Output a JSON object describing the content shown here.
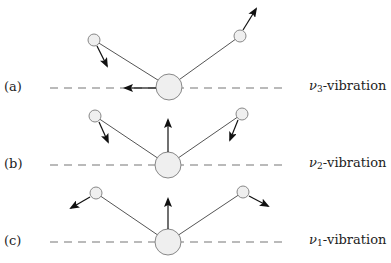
{
  "colors": {
    "atom_fill": "#efefef",
    "atom_stroke": "#888888",
    "bond": "#555555",
    "dash": "#777777",
    "arrow": "#111111",
    "text": "#222222"
  },
  "panels": [
    {
      "id": "a",
      "label": "(a)",
      "mode_symbol": "ν",
      "mode_subscript": "3",
      "mode_suffix": "-vibration",
      "axis_y": 88,
      "central_atom": {
        "cx": 169,
        "cy": 87,
        "r": 13
      },
      "left_atom": {
        "cx": 94,
        "cy": 40,
        "r": 6
      },
      "right_atom": {
        "cx": 240,
        "cy": 36,
        "r": 6
      },
      "arrows": [
        {
          "name": "central-atom-displacement",
          "x1": 156,
          "y1": 88,
          "x2": 125,
          "y2": 88
        },
        {
          "name": "left-atom-displacement",
          "x1": 97,
          "y1": 46,
          "x2": 107,
          "y2": 66
        },
        {
          "name": "right-atom-displacement",
          "x1": 243,
          "y1": 30,
          "x2": 256,
          "y2": 9
        }
      ]
    },
    {
      "id": "b",
      "label": "(b)",
      "mode_symbol": "ν",
      "mode_subscript": "2",
      "mode_suffix": "-vibration",
      "axis_y": 165,
      "central_atom": {
        "cx": 168,
        "cy": 165,
        "r": 13
      },
      "left_atom": {
        "cx": 95,
        "cy": 116,
        "r": 6
      },
      "right_atom": {
        "cx": 242,
        "cy": 114,
        "r": 6
      },
      "arrows": [
        {
          "name": "central-atom-displacement",
          "x1": 168,
          "y1": 152,
          "x2": 168,
          "y2": 120
        },
        {
          "name": "left-atom-displacement",
          "x1": 99,
          "y1": 122,
          "x2": 108,
          "y2": 142
        },
        {
          "name": "right-atom-displacement",
          "x1": 238,
          "y1": 120,
          "x2": 230,
          "y2": 140
        }
      ]
    },
    {
      "id": "c",
      "label": "(c)",
      "mode_symbol": "ν",
      "mode_subscript": "1",
      "mode_suffix": "-vibration",
      "axis_y": 242,
      "central_atom": {
        "cx": 168,
        "cy": 242,
        "r": 13
      },
      "left_atom": {
        "cx": 96,
        "cy": 193,
        "r": 6
      },
      "right_atom": {
        "cx": 243,
        "cy": 192,
        "r": 6
      },
      "arrows": [
        {
          "name": "central-atom-displacement",
          "x1": 168,
          "y1": 229,
          "x2": 168,
          "y2": 199
        },
        {
          "name": "left-atom-displacement",
          "x1": 90,
          "y1": 197,
          "x2": 71,
          "y2": 208
        },
        {
          "name": "right-atom-displacement",
          "x1": 249,
          "y1": 196,
          "x2": 268,
          "y2": 206
        }
      ]
    }
  ],
  "axis": {
    "x_start": 50,
    "x_end": 284,
    "dash": "8,6"
  }
}
